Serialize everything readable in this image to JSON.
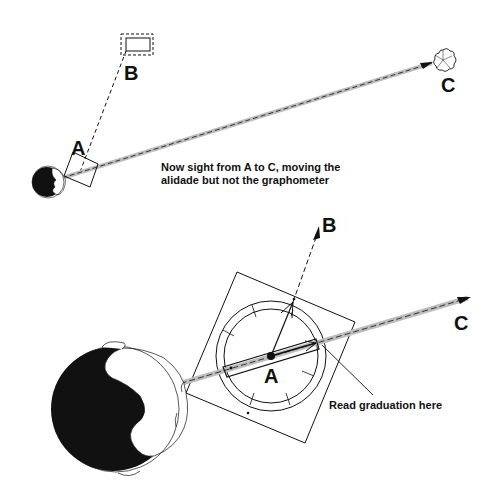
{
  "top_panel": {
    "labels": {
      "a": "A",
      "b": "B",
      "c": "C"
    },
    "caption_line1": "Now sight from A to C, moving the",
    "caption_line2": "alidade but not the graphometer"
  },
  "bottom_panel": {
    "labels": {
      "a": "A",
      "b": "B",
      "c": "C"
    },
    "callout": "Read graduation here"
  },
  "colors": {
    "ink": "#111111",
    "sightline": "#b5b5b5",
    "background": "#ffffff"
  }
}
